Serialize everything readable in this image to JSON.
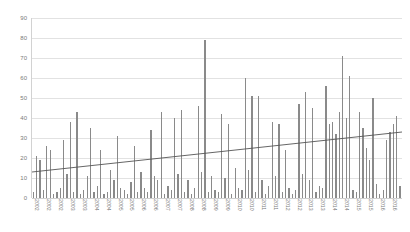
{
  "chart_data": {
    "type": "bar",
    "title": "",
    "subtitle": "",
    "xlabel": "",
    "ylabel": "",
    "ylim": [
      0,
      90
    ],
    "yticks": [
      0,
      10,
      20,
      30,
      40,
      50,
      60,
      70,
      80,
      90
    ],
    "ytick_labels": [
      "0",
      "10",
      "20",
      "30",
      "40",
      "50",
      "60",
      "70",
      "80",
      "90"
    ],
    "grid": true,
    "legend": "none",
    "bar_color": "#8a8a8a",
    "grid_color": "#e2e2e2",
    "axis_color": "#d2d2d2",
    "trendline": {
      "type": "linear",
      "color": "#555555",
      "start_value": 13,
      "end_value": 33,
      "visible": true
    },
    "categories": [
      "2002",
      "2002",
      "2002",
      "2002",
      "2002",
      "2002",
      "2002",
      "2002",
      "2003",
      "2003",
      "2003",
      "2003",
      "2003",
      "2003",
      "2003",
      "2004",
      "2004",
      "2004",
      "2004",
      "2004",
      "2004",
      "2004",
      "2005",
      "2005",
      "2005",
      "2005",
      "2005",
      "2005",
      "2006",
      "2006",
      "2006",
      "2006",
      "2006",
      "2006",
      "2007",
      "2007",
      "2007",
      "2007",
      "2007",
      "2007",
      "2007",
      "2008",
      "2008",
      "2008",
      "2008",
      "2008",
      "2008",
      "2008",
      "2009",
      "2009",
      "2009",
      "2009",
      "2009",
      "2009",
      "2009",
      "2010",
      "2010",
      "2010",
      "2010",
      "2010",
      "2010",
      "2010",
      "2011",
      "2011",
      "2011",
      "2011",
      "2011",
      "2011",
      "2011",
      "2011",
      "2012",
      "2012",
      "2012",
      "2012",
      "2012",
      "2012",
      "2012",
      "2012",
      "2013",
      "2013",
      "2013",
      "2013",
      "2013",
      "2013",
      "2013",
      "2013",
      "2014",
      "2014",
      "2014",
      "2014",
      "2014",
      "2014",
      "2014",
      "2014",
      "2014",
      "2014",
      "2015",
      "2015",
      "2015",
      "2015",
      "2015",
      "2015",
      "2015",
      "2015",
      "2016",
      "2016",
      "2016",
      "2016",
      "2016",
      "2016"
    ],
    "xtick_labels": [
      "2002",
      "2002",
      "2002",
      "2003",
      "2003",
      "2004",
      "2004",
      "2005",
      "2005",
      "2006",
      "2006",
      "2007",
      "2007",
      "2008",
      "2008",
      "2009",
      "2009",
      "2010",
      "2010",
      "2011",
      "2011",
      "2012",
      "2012",
      "2013",
      "2013",
      "2014",
      "2014",
      "2015",
      "2015",
      "2016",
      "2016"
    ],
    "values": [
      3,
      21,
      19,
      4,
      26,
      24,
      2,
      3,
      5,
      29,
      12,
      38,
      3,
      43,
      2,
      4,
      11,
      35,
      3,
      6,
      24,
      2,
      3,
      14,
      9,
      31,
      5,
      4,
      2,
      8,
      26,
      3,
      13,
      5,
      3,
      34,
      11,
      9,
      43,
      2,
      6,
      4,
      40,
      12,
      44,
      3,
      9,
      2,
      5,
      46,
      13,
      79,
      3,
      11,
      4,
      3,
      42,
      10,
      37,
      2,
      15,
      5,
      4,
      60,
      14,
      51,
      3,
      51,
      9,
      2,
      6,
      38,
      11,
      37,
      3,
      24,
      5,
      2,
      4,
      47,
      12,
      53,
      9,
      45,
      3,
      6,
      5,
      56,
      37,
      38,
      32,
      43,
      71,
      40,
      61,
      4,
      3,
      43,
      35,
      25,
      19,
      50,
      7,
      2,
      4,
      29,
      33,
      37,
      41,
      6
    ]
  }
}
